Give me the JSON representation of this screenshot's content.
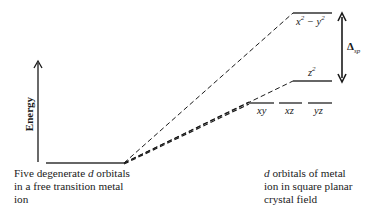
{
  "diagram": {
    "axis_label": "Energy",
    "left_caption": {
      "lines": [
        "Five degenerate d orbitals",
        "in a free transition metal",
        "ion"
      ],
      "italic_word": "d"
    },
    "right_caption": {
      "lines": [
        "d orbitals of metal",
        "ion in square planar",
        "crystal field"
      ],
      "italic_word": "d"
    },
    "levels": {
      "free_ion": {
        "label": "five degenerate d orbitals"
      },
      "x2_y2": {
        "label_base": "x",
        "label_sup": "2",
        "label_mid": " − y",
        "label_sup2": "2"
      },
      "z2": {
        "label_base": "z",
        "label_sup": "2"
      },
      "xy": {
        "label": "xy"
      },
      "xz": {
        "label": "xz"
      },
      "yz": {
        "label": "yz"
      }
    },
    "splitting": {
      "symbol": "Δ",
      "subscript": "sp"
    },
    "colors": {
      "line": "#1a1a1a",
      "level": "#333333"
    }
  }
}
